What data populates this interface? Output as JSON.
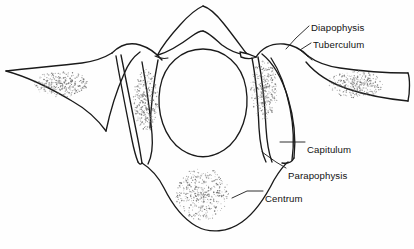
{
  "figure": {
    "kind": "anatomical-line-drawing",
    "background_color": "#fefefe",
    "ink_color": "#1a1a1a",
    "stipple_color": "#6b6b6b",
    "width": 414,
    "height": 249
  },
  "labels": [
    {
      "id": "diapophysis",
      "text": "Diapophysis",
      "x": 311,
      "y": 23
    },
    {
      "id": "tuberculum",
      "text": "Tuberculum",
      "x": 313,
      "y": 40
    },
    {
      "id": "capitulum",
      "text": "Capitulum",
      "x": 307,
      "y": 145
    },
    {
      "id": "parapophysis",
      "text": "Parapophysis",
      "x": 288,
      "y": 171
    },
    {
      "id": "centrum",
      "text": "Centrum",
      "x": 265,
      "y": 194
    }
  ],
  "stipple_patches": [
    {
      "id": "left-rib-shaft-section",
      "cx": 61,
      "cy": 84,
      "rx": 27,
      "ry": 13,
      "density": 300
    },
    {
      "id": "left-rib-head-section",
      "cx": 146,
      "cy": 100,
      "rx": 12,
      "ry": 31,
      "density": 300
    },
    {
      "id": "right-rib-head-section",
      "cx": 264,
      "cy": 90,
      "rx": 13,
      "ry": 30,
      "density": 300
    },
    {
      "id": "right-rib-shaft-section",
      "cx": 356,
      "cy": 84,
      "rx": 28,
      "ry": 13,
      "density": 300
    },
    {
      "id": "centrum-section",
      "cx": 202,
      "cy": 194,
      "rx": 26,
      "ry": 26,
      "density": 420
    }
  ]
}
